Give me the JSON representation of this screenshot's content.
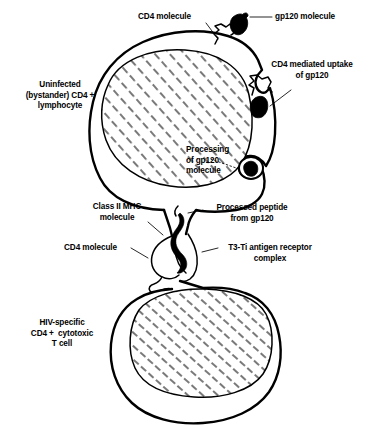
{
  "figure": {
    "background_color": "#ffffff",
    "ink_color": "#000000"
  },
  "labels": {
    "cd4_molecule_top": "CD4 molecule",
    "gp120_molecule": "gp120 molecule",
    "cd4_mediated_uptake": "CD4 mediated uptake\nof gp120",
    "uninfected_lymphocyte": "Uninfected\n(bystander) CD4 +\nlymphocyte",
    "processing_of_gp120": "Processing\nof gp120\nmolecule",
    "class_ii_mhc": "Class II MHC\nmolecule",
    "processed_peptide": "Processed peptide\nfrom gp120",
    "cd4_molecule_bottom": "CD4 molecule",
    "t3_ti_receptor": "T3-Ti antigen receptor\ncomplex",
    "hiv_specific_t_cell": "HIV-specific\nCD4 +  cytotoxic\nT cell"
  },
  "structures": {
    "upper_cell": "uninfected-bystander-cd4-lymphocyte",
    "upper_nucleus": "hatched-nucleus",
    "lower_cell": "hiv-specific-cytotoxic-t-cell",
    "lower_nucleus": "hatched-nucleus",
    "gp120_free": "free-gp120-molecule",
    "gp120_bound": "membrane-bound-gp120",
    "gp120_vesicle": "internalized-gp120-vesicle",
    "mhc_peptide_complex": "class-ii-mhc-peptide-complex",
    "cd4_receptor_zigzag": "cd4-receptor"
  }
}
